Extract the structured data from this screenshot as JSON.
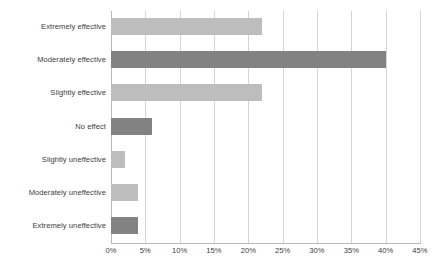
{
  "chart_data": {
    "type": "bar",
    "orientation": "horizontal",
    "title": "",
    "subtitle": "",
    "xlabel": "",
    "ylabel": "",
    "categories": [
      "Extremely effective",
      "Moderately effective",
      "Slightly effective",
      "No effect",
      "Slightly uneffective",
      "Moderately uneffective",
      "Extremely uneffective"
    ],
    "values": [
      22,
      40,
      22,
      6,
      2,
      4,
      4
    ],
    "value_unit": "%",
    "bar_colors": [
      "#bdbdbd",
      "#828282",
      "#bdbdbd",
      "#828282",
      "#bdbdbd",
      "#bdbdbd",
      "#828282"
    ],
    "xlim": [
      0,
      45
    ],
    "xticks": [
      0,
      5,
      10,
      15,
      20,
      25,
      30,
      35,
      40,
      45
    ],
    "xtick_labels": [
      "0%",
      "5%",
      "10%",
      "15%",
      "20%",
      "25%",
      "30%",
      "35%",
      "40%",
      "45%"
    ],
    "grid": "vertical",
    "gridline_color": "#d4d4d4",
    "legend": "none",
    "annotations": []
  },
  "figure": {
    "caption": "",
    "background": "#ffffff",
    "axis_color": "#b9b9b9",
    "text_color": "#3d3d3d"
  }
}
